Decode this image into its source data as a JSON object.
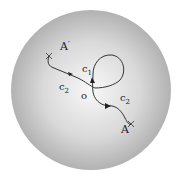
{
  "diagram": {
    "colors": {
      "disk_center": "#f7f7f7",
      "disk_edge": "#a9a9a9",
      "stroke": "#333333"
    },
    "labels": {
      "a_prime": "A",
      "a_prime_mark": "′",
      "a": "A",
      "a_mark": "′",
      "o": "o",
      "c1": "c",
      "c1_sub": "1",
      "c2_left": "c",
      "c2_left_sub": "2",
      "c2_right": "c",
      "c2_right_sub": "2"
    }
  }
}
